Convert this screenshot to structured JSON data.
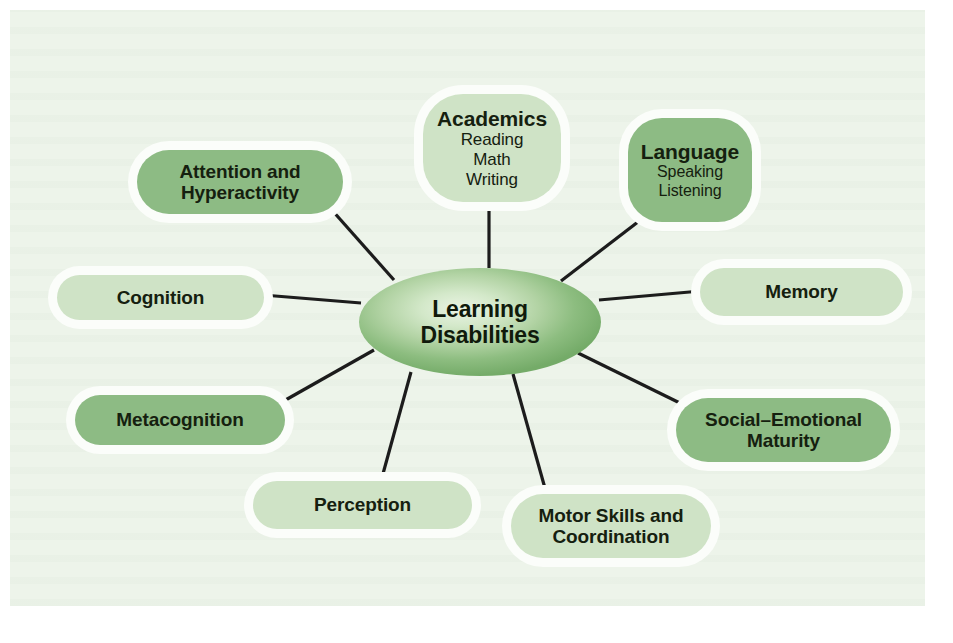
{
  "figure": {
    "kind": "concept-map",
    "panel_background": "#edf4ea",
    "page_background": "#ffffff",
    "edge_color": "#1c1c1c",
    "text_color": "#15200f",
    "tone_light": "#cfe3c6",
    "tone_mid": "#8dbb84",
    "halo_color": "#fbfdfa"
  },
  "hub": {
    "line1": "Learning",
    "line2": "Disabilities",
    "cx": 480,
    "cy": 322,
    "rx": 121,
    "ry": 54
  },
  "nodes": [
    {
      "id": "academics",
      "title": "Academics",
      "sub": [
        "Reading",
        "Math",
        "Writing"
      ],
      "tone": "light",
      "shape": "rounded-square",
      "x": 423,
      "y": 94,
      "w": 138,
      "h": 108,
      "radius": 40,
      "title_size": 21,
      "sub_size": 17,
      "anchor_x": 489,
      "anchor_y": 202
    },
    {
      "id": "language",
      "title": "Language",
      "sub": [
        "Speaking",
        "Listening"
      ],
      "tone": "mid",
      "shape": "rounded-square",
      "x": 628,
      "y": 118,
      "w": 124,
      "h": 104,
      "radius": 34,
      "title_size": 21,
      "sub_size": 16,
      "anchor_x": 645,
      "anchor_y": 214
    },
    {
      "id": "memory",
      "title": "Memory",
      "sub": [],
      "tone": "light",
      "shape": "pill",
      "x": 700,
      "y": 268,
      "w": 203,
      "h": 48,
      "radius": 24,
      "title_size": 19,
      "sub_size": 0,
      "anchor_x": 700,
      "anchor_y": 292
    },
    {
      "id": "social-emotional-maturity",
      "title": "Social–Emotional\nMaturity",
      "sub": [],
      "tone": "mid",
      "shape": "pill",
      "x": 676,
      "y": 398,
      "w": 215,
      "h": 64,
      "radius": 32,
      "title_size": 19,
      "sub_size": 0,
      "anchor_x": 686,
      "anchor_y": 406
    },
    {
      "id": "motor-skills-and-coordination",
      "title": "Motor Skills and\nCoordination",
      "sub": [],
      "tone": "light",
      "shape": "pill",
      "x": 511,
      "y": 494,
      "w": 200,
      "h": 64,
      "radius": 32,
      "title_size": 19,
      "sub_size": 0,
      "anchor_x": 546,
      "anchor_y": 498
    },
    {
      "id": "perception",
      "title": "Perception",
      "sub": [],
      "tone": "light",
      "shape": "pill",
      "x": 253,
      "y": 481,
      "w": 219,
      "h": 48,
      "radius": 24,
      "title_size": 19,
      "sub_size": 0,
      "anchor_x": 382,
      "anchor_y": 481
    },
    {
      "id": "metacognition",
      "title": "Metacognition",
      "sub": [],
      "tone": "mid",
      "shape": "pill",
      "x": 75,
      "y": 395,
      "w": 210,
      "h": 50,
      "radius": 25,
      "title_size": 19,
      "sub_size": 0,
      "anchor_x": 281,
      "anchor_y": 401
    },
    {
      "id": "cognition",
      "title": "Cognition",
      "sub": [],
      "tone": "light",
      "shape": "pill",
      "x": 57,
      "y": 275,
      "w": 207,
      "h": 45,
      "radius": 23,
      "title_size": 19,
      "sub_size": 0,
      "anchor_x": 262,
      "anchor_y": 295
    },
    {
      "id": "attention-and-hyperactivity",
      "title": "Attention and\nHyperactivity",
      "sub": [],
      "tone": "mid",
      "shape": "pill",
      "x": 137,
      "y": 150,
      "w": 206,
      "h": 64,
      "radius": 32,
      "title_size": 19,
      "sub_size": 0,
      "anchor_x": 329,
      "anchor_y": 208
    }
  ],
  "edges": [
    {
      "id": "edge-academics",
      "from": "hub",
      "to": "academics",
      "x1": 489,
      "y1": 268,
      "x2": 489,
      "y2": 203
    },
    {
      "id": "edge-language",
      "from": "hub",
      "to": "language",
      "x1": 561,
      "y1": 281,
      "x2": 647,
      "y2": 215
    },
    {
      "id": "edge-memory",
      "from": "hub",
      "to": "memory",
      "x1": 599,
      "y1": 300,
      "x2": 701,
      "y2": 291
    },
    {
      "id": "edge-social",
      "from": "hub",
      "to": "social-emotional-maturity",
      "x1": 578,
      "y1": 353,
      "x2": 688,
      "y2": 407
    },
    {
      "id": "edge-motor",
      "from": "hub",
      "to": "motor-skills-and-coordination",
      "x1": 513,
      "y1": 374,
      "x2": 548,
      "y2": 499
    },
    {
      "id": "edge-perception",
      "from": "hub",
      "to": "perception",
      "x1": 411,
      "y1": 372,
      "x2": 381,
      "y2": 481
    },
    {
      "id": "edge-metacog",
      "from": "hub",
      "to": "metacognition",
      "x1": 374,
      "y1": 350,
      "x2": 282,
      "y2": 402
    },
    {
      "id": "edge-cognition",
      "from": "hub",
      "to": "cognition",
      "x1": 361,
      "y1": 303,
      "x2": 263,
      "y2": 295
    },
    {
      "id": "edge-attention",
      "from": "hub",
      "to": "attention-and-hyperactivity",
      "x1": 394,
      "y1": 280,
      "x2": 331,
      "y2": 209
    }
  ]
}
